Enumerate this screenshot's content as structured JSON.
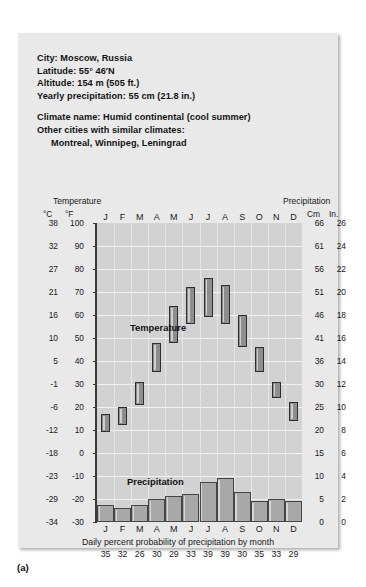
{
  "figure": {
    "letter": "(a)"
  },
  "info": {
    "city_line": "City: Moscow, Russia",
    "latitude_line": "Latitude: 55° 46′N",
    "altitude_line": "Altitude: 154 m (505 ft.)",
    "precip_line": "Yearly precipitation: 55 cm (21.8 in.)",
    "climate_name_line": "Climate name: Humid continental (cool summer)",
    "similar_label": "Other cities with similar climates:",
    "similar_cities": "Montreal, Winnipeg, Leningrad"
  },
  "axes": {
    "temperature_caption": "Temperature",
    "precipitation_caption": "Precipitation",
    "unit_celsius": "°C",
    "unit_fahrenheit": "°F",
    "unit_cm": "Cm",
    "unit_in": "In."
  },
  "labels": {
    "temperature_series": "Temperature",
    "precipitation_series": "Precipitation"
  },
  "footer": {
    "caption": "Daily percent probability of precipitation by month"
  },
  "colors": {
    "card_background": "#e9e9e9",
    "plot_background": "#d2d2d2",
    "temperature_bar_fill": "#8e8e8e",
    "temperature_bar_border": "#2e2e2e",
    "precipitation_bar_fill": "#a8a8a8",
    "precipitation_bar_border": "#454545",
    "gridline": "#f2f2f2",
    "axis_spine": "#3a3a3a",
    "text": "#141414"
  },
  "chart_data": {
    "type": "bar",
    "subtitle": "Humid continental (cool summer)",
    "xlabel": "",
    "ylabel": "Temperature / Precipitation",
    "grid": true,
    "legend": "in-plot labels",
    "categories": [
      "J",
      "F",
      "M",
      "A",
      "M",
      "J",
      "J",
      "A",
      "S",
      "O",
      "N",
      "D"
    ],
    "month_names": [
      "January",
      "February",
      "March",
      "April",
      "May",
      "June",
      "July",
      "August",
      "September",
      "October",
      "November",
      "December"
    ],
    "axis_temperature_f": {
      "ticks_f": [
        100,
        90,
        80,
        70,
        60,
        50,
        40,
        30,
        20,
        10,
        0,
        -10,
        -20,
        -30
      ],
      "ticks_c": [
        38,
        32,
        27,
        21,
        16,
        10,
        5,
        -1,
        -6,
        -12,
        -18,
        -23,
        -29,
        -34
      ],
      "ylim_f": [
        -30,
        100
      ],
      "unit_primary": "°C",
      "unit_secondary": "°F"
    },
    "axis_precipitation": {
      "ticks_in": [
        26,
        24,
        22,
        20,
        18,
        16,
        14,
        12,
        10,
        8,
        6,
        4,
        2,
        0
      ],
      "ticks_cm": [
        66,
        61,
        56,
        51,
        46,
        41,
        36,
        30,
        25,
        20,
        15,
        10,
        5,
        0
      ],
      "ylim_in": [
        0,
        26
      ],
      "unit_primary": "Cm",
      "unit_secondary": "In."
    },
    "series": [
      {
        "name": "Temperature",
        "type": "range-bar",
        "unit": "°F",
        "note": "Each bar spans the average monthly low to the average monthly high.",
        "low_f": [
          9,
          12,
          21,
          35,
          48,
          56,
          59,
          56,
          46,
          35,
          24,
          14
        ],
        "high_f": [
          17,
          20,
          31,
          48,
          64,
          72,
          76,
          73,
          60,
          46,
          31,
          22
        ],
        "low_c": [
          -13,
          -11,
          -6,
          2,
          9,
          13,
          15,
          13,
          8,
          2,
          -4,
          -10
        ],
        "high_c": [
          -8,
          -7,
          -1,
          9,
          18,
          22,
          24,
          23,
          16,
          8,
          -1,
          -6
        ]
      },
      {
        "name": "Precipitation",
        "type": "bar",
        "unit": "in.",
        "values_in": [
          1.5,
          1.2,
          1.5,
          2.0,
          2.3,
          2.4,
          3.5,
          3.8,
          2.6,
          1.8,
          2.0,
          1.8
        ],
        "values_cm": [
          3.8,
          3.0,
          3.8,
          5.1,
          5.8,
          6.1,
          8.9,
          9.7,
          6.6,
          4.6,
          5.1,
          4.6
        ]
      }
    ],
    "daily_percent_probability_of_precipitation": [
      35,
      32,
      26,
      30,
      29,
      33,
      39,
      39,
      30,
      35,
      33,
      29
    ],
    "annotations": [
      "Yearly precipitation: 55 cm (21.8 in.)",
      "Latitude: 55° 46′N",
      "Altitude: 154 m (505 ft.)"
    ]
  }
}
